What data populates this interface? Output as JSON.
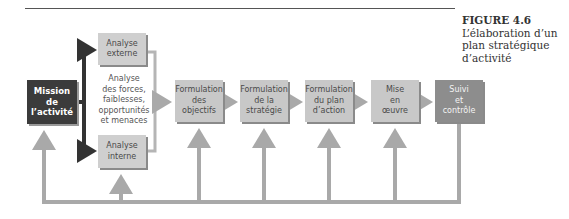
{
  "figure": {
    "number": "FIGURE 4.6",
    "title": "L’élaboration d’un plan stratégique d’activité"
  },
  "diagram": {
    "mission": "Mission\nde\nl’activité",
    "external_analysis": "Analyse\nexterne",
    "swot_text": "Analyse\ndes forces,\nfaiblesses,\nopportunités\net menaces",
    "internal_analysis": "Analyse\ninterne",
    "steps": [
      "Formulation\ndes\nobjectifs",
      "Formulation\nde la\nstratégie",
      "Formulation\ndu plan\nd’action",
      "Mise\nen\nœuvre",
      "Suivi\net\ncontrôle"
    ]
  },
  "colors": {
    "mission_fill": "#3b3b3b",
    "step_fill": "#c8c8c8",
    "control_fill": "#8d8d8d",
    "arrow": "#a9a9a9",
    "arrow_dark": "#333333"
  }
}
